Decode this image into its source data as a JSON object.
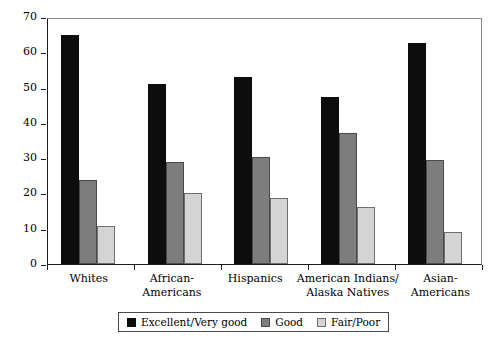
{
  "chart_data": {
    "type": "bar",
    "title": "",
    "xlabel": "",
    "ylabel": "Percentage of respondents",
    "ylim": [
      0,
      70
    ],
    "yticks": [
      0,
      10,
      20,
      30,
      40,
      50,
      60,
      70
    ],
    "grid": false,
    "legend_position": "bottom",
    "categories": [
      "Whites",
      "African-Americans",
      "Hispanics",
      "American Indians/Alaska Natives",
      "Asian-Americans"
    ],
    "category_lines": [
      [
        "Whites"
      ],
      [
        "African-",
        "Americans"
      ],
      [
        "Hispanics"
      ],
      [
        "American Indians/",
        "Alaska Natives"
      ],
      [
        "Asian-",
        "Americans"
      ]
    ],
    "series": [
      {
        "name": "Excellent/Very good",
        "color": "#0d0d0d",
        "values": [
          65,
          51,
          53,
          47.3,
          62.5
        ]
      },
      {
        "name": "Good",
        "color": "#7d7d7d",
        "values": [
          23.8,
          29,
          30.3,
          37,
          29.4
        ]
      },
      {
        "name": "Fair/Poor",
        "color": "#d4d4d4",
        "values": [
          10.7,
          20.2,
          18.6,
          16.2,
          9
        ]
      }
    ]
  }
}
